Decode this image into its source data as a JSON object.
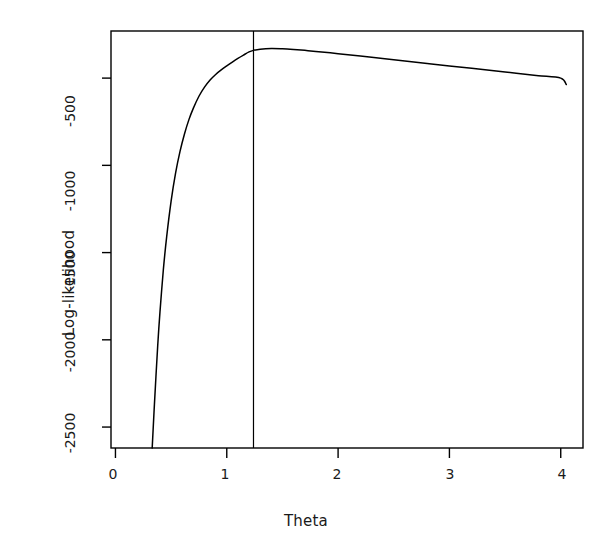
{
  "chart_data": {
    "type": "line",
    "title": "",
    "subtitle": "",
    "xlabel": "Theta",
    "ylabel": "Log-likelihood",
    "xlim": [
      -0.04,
      4.2
    ],
    "ylim": [
      -2620,
      -230
    ],
    "xticks": [
      0,
      1,
      2,
      3,
      4
    ],
    "xtick_labels": [
      "0",
      "1",
      "2",
      "3",
      "4"
    ],
    "yticks": [
      -500,
      -1000,
      -1500,
      -2000,
      -2500
    ],
    "ytick_labels": [
      "-500",
      "-1000",
      "-1500",
      "-2000",
      "-2500"
    ],
    "grid": false,
    "legend": null,
    "box": true,
    "series": [
      {
        "name": "profile log-likelihood",
        "color": "#000000",
        "x": [
          0.33,
          0.35,
          0.38,
          0.4,
          0.43,
          0.46,
          0.5,
          0.54,
          0.58,
          0.62,
          0.66,
          0.7,
          0.75,
          0.8,
          0.85,
          0.9,
          0.95,
          1.0,
          1.05,
          1.1,
          1.15,
          1.2,
          1.24,
          1.3,
          1.4,
          1.5,
          1.6,
          1.7,
          1.8,
          2.0,
          2.2,
          2.4,
          2.6,
          2.8,
          3.0,
          3.2,
          3.4,
          3.6,
          3.8,
          4.0,
          4.05
        ],
        "y": [
          -2620,
          -2370,
          -2030,
          -1840,
          -1600,
          -1410,
          -1205,
          -1045,
          -920,
          -820,
          -738,
          -672,
          -604,
          -552,
          -511,
          -479,
          -453,
          -430,
          -408,
          -387,
          -368,
          -350,
          -341,
          -334,
          -330,
          -332,
          -336,
          -341,
          -347,
          -360,
          -374,
          -388,
          -402,
          -416,
          -430,
          -444,
          -458,
          -472,
          -486,
          -500,
          -537
        ]
      }
    ],
    "annotations": [
      {
        "type": "vline",
        "name": "mle-vertical-line",
        "x": 1.24,
        "color": "#000000",
        "label": ""
      }
    ]
  },
  "figure": {
    "background": "#ffffff",
    "foreground": "#000000"
  }
}
